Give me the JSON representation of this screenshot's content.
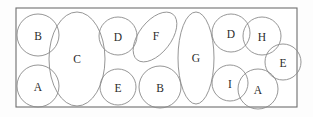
{
  "figure": {
    "kind": "packing-diagram",
    "canvas": {
      "width": 313,
      "height": 117
    },
    "background_color": "#fdfdfd",
    "container": {
      "name": "container-rectangle",
      "x": 16,
      "y": 8,
      "width": 281,
      "height": 99,
      "fill": "#ffffff",
      "stroke": "#6e6e6e",
      "stroke_width": 1.1
    },
    "shape_style": {
      "fill": "none",
      "stroke": "#8a8a8a",
      "stroke_width": 0.9,
      "label_color": "#2b2b2b",
      "label_font_size": 11.5
    },
    "shapes": [
      {
        "label": "B",
        "type": "circle",
        "cx": 38,
        "cy": 35,
        "rx": 21,
        "ry": 21,
        "rotation": 0,
        "label_x": 38,
        "label_y": 36
      },
      {
        "label": "A",
        "type": "circle",
        "cx": 38,
        "cy": 86,
        "rx": 21,
        "ry": 21,
        "rotation": 0,
        "label_x": 38,
        "label_y": 87
      },
      {
        "label": "C",
        "type": "ellipse",
        "cx": 77,
        "cy": 59,
        "rx": 28,
        "ry": 47,
        "rotation": 0,
        "label_x": 77,
        "label_y": 59
      },
      {
        "label": "D",
        "type": "circle",
        "cx": 118,
        "cy": 36,
        "rx": 19,
        "ry": 19,
        "rotation": 0,
        "label_x": 118,
        "label_y": 37
      },
      {
        "label": "E",
        "type": "circle",
        "cx": 118,
        "cy": 87,
        "rx": 18,
        "ry": 18,
        "rotation": 0,
        "label_x": 118,
        "label_y": 88
      },
      {
        "label": "F",
        "type": "ellipse",
        "cx": 155,
        "cy": 37,
        "rx": 29,
        "ry": 16,
        "rotation": -52,
        "label_x": 156,
        "label_y": 36
      },
      {
        "label": "B",
        "type": "circle",
        "cx": 160,
        "cy": 87,
        "rx": 21,
        "ry": 21,
        "rotation": 0,
        "label_x": 160,
        "label_y": 88
      },
      {
        "label": "G",
        "type": "ellipse",
        "cx": 196,
        "cy": 58,
        "rx": 18,
        "ry": 46,
        "rotation": 0,
        "label_x": 196,
        "label_y": 58
      },
      {
        "label": "D",
        "type": "circle",
        "cx": 231,
        "cy": 33,
        "rx": 19,
        "ry": 19,
        "rotation": 0,
        "label_x": 231,
        "label_y": 34
      },
      {
        "label": "H",
        "type": "circle",
        "cx": 262,
        "cy": 36,
        "rx": 19,
        "ry": 19,
        "rotation": 0,
        "label_x": 262,
        "label_y": 37
      },
      {
        "label": "E",
        "type": "circle",
        "cx": 283,
        "cy": 62,
        "rx": 18,
        "ry": 18,
        "rotation": 0,
        "label_x": 283,
        "label_y": 63
      },
      {
        "label": "I",
        "type": "circle",
        "cx": 230,
        "cy": 83,
        "rx": 18,
        "ry": 18,
        "rotation": 0,
        "label_x": 230,
        "label_y": 84
      },
      {
        "label": "A",
        "type": "circle",
        "cx": 258,
        "cy": 89,
        "rx": 20,
        "ry": 20,
        "rotation": 0,
        "label_x": 258,
        "label_y": 90
      }
    ]
  }
}
